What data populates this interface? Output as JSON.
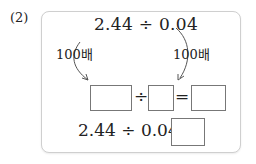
{
  "problem_number": "(2)",
  "top_expression": "2.44 ÷ 0.04",
  "left_multiplier": "100배",
  "right_multiplier": "100배",
  "middle_row": {
    "divide_sign": "÷",
    "equals_sign": "="
  },
  "bottom_row": {
    "expression": "2.44 ÷ 0.04 ="
  }
}
